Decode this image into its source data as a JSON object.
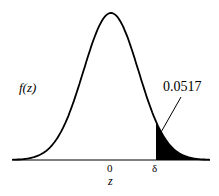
{
  "figure": {
    "ylabel": "f(z)",
    "xlabel": "z",
    "ticks": [
      {
        "label": "0",
        "value": 0
      },
      {
        "label": "δ",
        "value": 1.63
      }
    ],
    "annotation": "0.0517"
  },
  "chart_data": {
    "type": "area",
    "title": "",
    "xlabel": "z",
    "ylabel": "f(z)",
    "curve": "standard normal density",
    "tick_labels": [
      "0",
      "δ"
    ],
    "shaded_region": {
      "from": "δ",
      "to": "+inf",
      "area": 0.0517
    },
    "annotations": [
      "0.0517"
    ],
    "grid": false
  }
}
